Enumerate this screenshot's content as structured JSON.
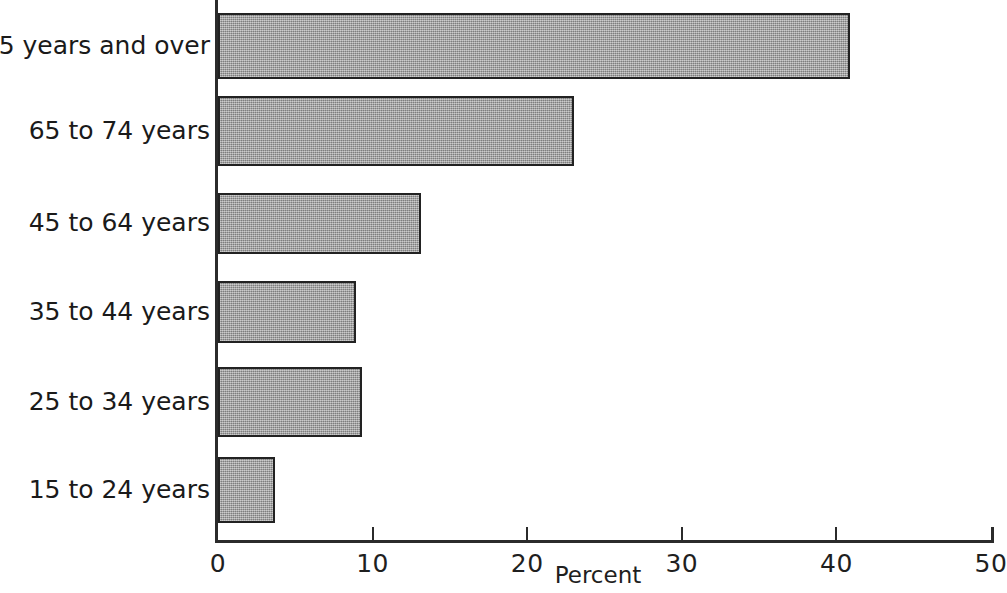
{
  "chart_data": {
    "type": "bar",
    "orientation": "horizontal",
    "title": "",
    "subtitle": "",
    "xlabel": "Percent",
    "ylabel": "",
    "categories": [
      "15 to 24 years",
      "25 to 34 years",
      "35 to 44 years",
      "45 to 64 years",
      "65 to 74 years",
      "75 years and over"
    ],
    "values": [
      3.7,
      9.3,
      8.9,
      13.1,
      23.0,
      40.9
    ],
    "series": [
      {
        "name": "Percent",
        "values": [
          3.7,
          9.3,
          8.9,
          13.1,
          23.0,
          40.9
        ]
      }
    ],
    "xlim": [
      0,
      50
    ],
    "xticks": [
      0,
      10,
      20,
      30,
      40,
      50
    ],
    "xtick_labels": [
      "0",
      "10",
      "20",
      "30",
      "40",
      "50"
    ],
    "grid": false,
    "legend": null,
    "bar_fill_color": "#9a9a9a",
    "bar_edge_color": "#222222",
    "axis_color": "#2b2b2b",
    "background_color": "#ffffff",
    "annotations": []
  },
  "bars": [
    {
      "category": "75 years and over",
      "value": 40.9,
      "top": 13,
      "height": 66
    },
    {
      "category": "65 to 74 years",
      "value": 23.0,
      "top": 96,
      "height": 70
    },
    {
      "category": "45 to 64 years",
      "value": 13.1,
      "top": 193,
      "height": 61
    },
    {
      "category": "35 to 44 years",
      "value": 8.9,
      "top": 281,
      "height": 62
    },
    {
      "category": "25 to 34 years",
      "value": 9.3,
      "top": 367,
      "height": 70
    },
    {
      "category": "15 to 24 years",
      "value": 3.7,
      "top": 457,
      "height": 66
    }
  ],
  "ticks": [
    {
      "label": "0",
      "value": 0
    },
    {
      "label": "10",
      "value": 10
    },
    {
      "label": "20",
      "value": 20
    },
    {
      "label": "30",
      "value": 30
    },
    {
      "label": "40",
      "value": 40
    },
    {
      "label": "50",
      "value": 50
    }
  ],
  "axis": {
    "x_title": "Percent"
  }
}
